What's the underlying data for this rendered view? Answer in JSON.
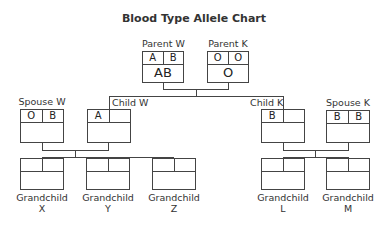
{
  "title": "Blood Type Allele Chart",
  "people": {
    "parent_w": {
      "label": "Parent W",
      "allele_1": "A",
      "allele_2": "B",
      "blood_type": "AB"
    },
    "parent_k": {
      "label": "Parent K",
      "allele_1": "O",
      "allele_2": "O",
      "blood_type": "O"
    },
    "spouse_w": {
      "label": "Spouse W",
      "allele_1": "O",
      "allele_2": "B",
      "blood_type": ""
    },
    "child_w": {
      "label": "Child W",
      "allele_1": "A",
      "allele_2": "",
      "blood_type": ""
    },
    "child_k": {
      "label": "Child K",
      "allele_1": "B",
      "allele_2": "",
      "blood_type": ""
    },
    "spouse_k": {
      "label": "Spouse K",
      "allele_1": "B",
      "allele_2": "B",
      "blood_type": ""
    },
    "grandchild_x": {
      "label_line1": "Grandchild",
      "label_line2": "X",
      "allele_1": "",
      "allele_2": "",
      "blood_type": ""
    },
    "grandchild_y": {
      "label_line1": "Grandchild",
      "label_line2": "Y",
      "allele_1": "",
      "allele_2": "",
      "blood_type": ""
    },
    "grandchild_z": {
      "label_line1": "Grandchild",
      "label_line2": "Z",
      "allele_1": "",
      "allele_2": "",
      "blood_type": ""
    },
    "grandchild_l": {
      "label_line1": "Grandchild",
      "label_line2": "L",
      "allele_1": "",
      "allele_2": "",
      "blood_type": ""
    },
    "grandchild_m": {
      "label_line1": "Grandchild",
      "label_line2": "M",
      "allele_1": "",
      "allele_2": "",
      "blood_type": ""
    }
  }
}
